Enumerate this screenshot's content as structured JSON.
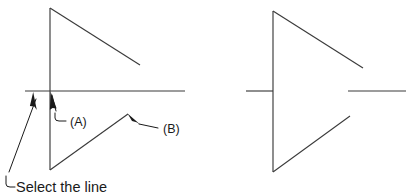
{
  "figure": {
    "title": "",
    "background_color": "#ffffff",
    "line_color": "#3a3a3a",
    "annotation_color": "#1a1a1a",
    "labels": {
      "label_a": "(A)",
      "label_b": "(B)",
      "caption": "Select the line"
    },
    "panels": [
      {
        "name": "before-panel",
        "description": "Partial arrow/triangle outline with a long horizontal construction line crossing it",
        "shapes": [
          {
            "name": "vertical-line",
            "type": "line",
            "points": [
              [
                50,
                8
              ],
              [
                50,
                170
              ]
            ]
          },
          {
            "name": "upper-diagonal-line",
            "type": "line",
            "points": [
              [
                50,
                8
              ],
              [
                140,
                65
              ]
            ]
          },
          {
            "name": "horizontal-construction-line",
            "type": "line",
            "points": [
              [
                25,
                91
              ],
              [
                185,
                91
              ]
            ]
          },
          {
            "name": "lower-diagonal-line",
            "type": "line",
            "points": [
              [
                50,
                170
              ],
              [
                128,
                114
              ]
            ]
          }
        ],
        "annotations": [
          {
            "name": "annotation-a",
            "label": "(A)",
            "arrow_tip": [
              51,
              92
            ],
            "text_pos": [
              70,
              121
            ]
          },
          {
            "name": "annotation-b",
            "label": "(B)",
            "arrow_tip": [
              128,
              114
            ],
            "text_pos": [
              163,
              132
            ]
          },
          {
            "name": "annotation-select-the-line",
            "label": "Select the line",
            "arrow_tip": [
              33,
              93
            ],
            "text_pos": [
              16,
              189
            ]
          }
        ]
      },
      {
        "name": "after-panel",
        "description": "Resulting arrow/triangle symbol with short horizontal stubs on each side",
        "shapes": [
          {
            "name": "vertical-line",
            "type": "line",
            "points": [
              [
                273,
                11
              ],
              [
                273,
                172
              ]
            ]
          },
          {
            "name": "upper-diagonal-line",
            "type": "line",
            "points": [
              [
                273,
                11
              ],
              [
                363,
                68
              ]
            ]
          },
          {
            "name": "lower-diagonal-line",
            "type": "line",
            "points": [
              [
                273,
                172
              ],
              [
                350,
                116
              ]
            ]
          },
          {
            "name": "left-stub-line",
            "type": "line",
            "points": [
              [
                246,
                91
              ],
              [
                273,
                91
              ]
            ]
          },
          {
            "name": "right-stub-line",
            "type": "line",
            "points": [
              [
                348,
                91
              ],
              [
                406,
                91
              ]
            ]
          }
        ],
        "annotations": []
      }
    ]
  }
}
